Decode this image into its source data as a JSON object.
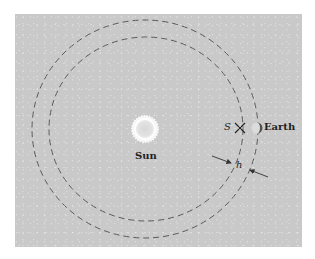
{
  "diagram": {
    "labels": {
      "sun": "Sun",
      "earth": "Earth",
      "satellite": "S",
      "gap": "h"
    },
    "colors": {
      "panel": "#c9c9c9",
      "orbit": "#5a5a5a",
      "sun_fill": "#e6e6e6",
      "sun_glow": "#f7f7f7",
      "earth_dark": "#505050",
      "text": "#1f1f1f"
    },
    "orbits": [
      {
        "name": "outer-orbit",
        "cx": 145,
        "cy": 129,
        "rx": 113,
        "ry": 109
      },
      {
        "name": "inner-orbit",
        "cx": 145,
        "cy": 129,
        "rx": 97,
        "ry": 92
      }
    ]
  }
}
